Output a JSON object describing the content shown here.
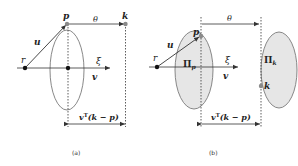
{
  "figure": {
    "panels": [
      {
        "id": "a",
        "caption": "(a)",
        "labels": {
          "r": "r",
          "p": "p",
          "k": "k",
          "u": "u",
          "theta": "θ",
          "xi": "ξ",
          "v": "v",
          "projection": "v",
          "projection_sup": "T",
          "projection_rest": "(k − p)"
        }
      },
      {
        "id": "b",
        "caption": "(b)",
        "labels": {
          "r": "r",
          "p": "p",
          "k": "k",
          "u": "u",
          "theta": "θ",
          "xi": "ξ",
          "v": "v",
          "plane_p": "Π",
          "plane_p_sub": "p",
          "plane_k": "Π",
          "plane_k_sub": "k",
          "projection": "v",
          "projection_sup": "T",
          "projection_rest": "(k − p)"
        }
      }
    ],
    "colors": {
      "stroke": "#333333",
      "ellipse_stroke": "#7a7a7a",
      "ellipse_fill_b": "#e6e6e6",
      "point_dark": "#111111",
      "point_gray": "#8a8a8a"
    }
  }
}
